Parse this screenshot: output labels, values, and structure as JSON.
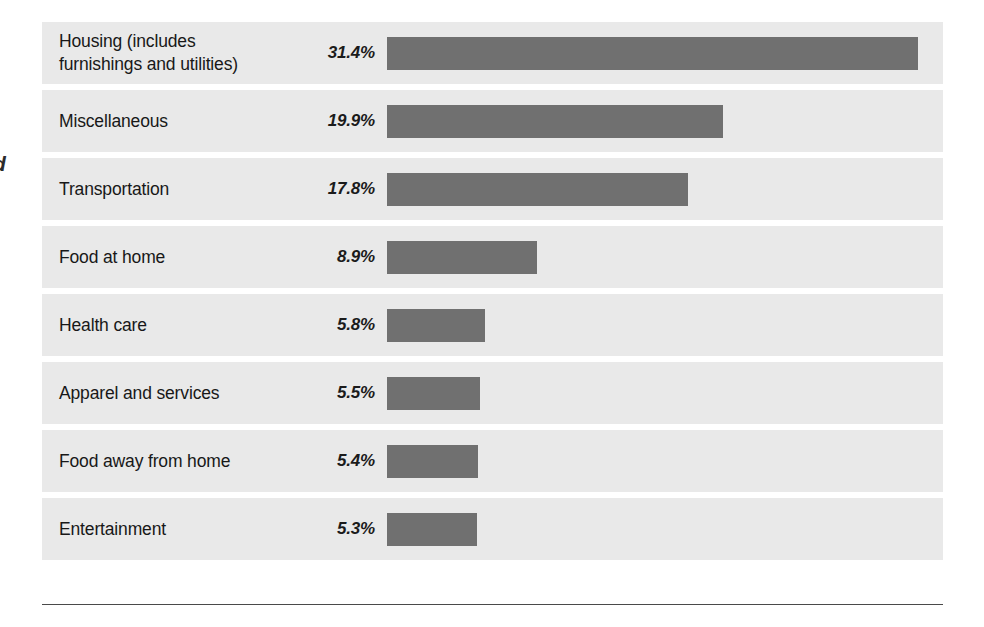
{
  "edge_marginalia": {
    "partial_glyph": "d"
  },
  "chart_data": {
    "type": "bar",
    "orientation": "horizontal",
    "title": "",
    "subtitle": "",
    "xlabel": "",
    "ylabel": "",
    "xlim": [
      0,
      33
    ],
    "grid": false,
    "legend": false,
    "value_suffix": "%",
    "bar_color": "#707070",
    "row_band_color": "#e9e9e9",
    "categories": [
      "Housing (includes furnishings and utilities)",
      "Miscellaneous",
      "Transportation",
      "Food at home",
      "Health care",
      "Apparel and services",
      "Food away from home",
      "Entertainment"
    ],
    "values": [
      31.4,
      19.9,
      17.8,
      8.9,
      5.8,
      5.5,
      5.4,
      5.3
    ],
    "value_labels": [
      "31.4%",
      "19.9%",
      "17.8%",
      "8.9%",
      "5.8%",
      "5.5%",
      "5.4%",
      "5.3%"
    ],
    "rows": [
      {
        "label_line1": "Housing (includes",
        "label_line2": "furnishings and utilities)",
        "label": "Housing (includes furnishings and utilities)",
        "value": 31.4,
        "value_label": "31.4%"
      },
      {
        "label_line1": "Miscellaneous",
        "label_line2": "",
        "label": "Miscellaneous",
        "value": 19.9,
        "value_label": "19.9%"
      },
      {
        "label_line1": "Transportation",
        "label_line2": "",
        "label": "Transportation",
        "value": 17.8,
        "value_label": "17.8%"
      },
      {
        "label_line1": "Food at home",
        "label_line2": "",
        "label": "Food at home",
        "value": 8.9,
        "value_label": "8.9%"
      },
      {
        "label_line1": "Health care",
        "label_line2": "",
        "label": "Health care",
        "value": 5.8,
        "value_label": "5.8%"
      },
      {
        "label_line1": "Apparel and services",
        "label_line2": "",
        "label": "Apparel and services",
        "value": 5.5,
        "value_label": "5.5%"
      },
      {
        "label_line1": "Food away from home",
        "label_line2": "",
        "label": "Food away from home",
        "value": 5.4,
        "value_label": "5.4%"
      },
      {
        "label_line1": "Entertainment",
        "label_line2": "",
        "label": "Entertainment",
        "value": 5.3,
        "value_label": "5.3%"
      }
    ]
  }
}
